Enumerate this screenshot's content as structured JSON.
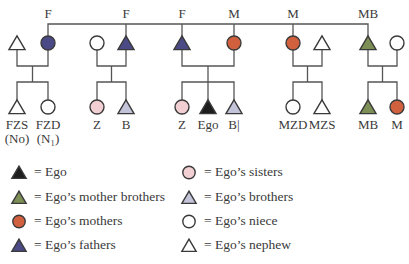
{
  "colors": {
    "line": "#555555",
    "ego": "#1e1e1e",
    "mother_brother": "#7d8f57",
    "mother": "#d1603f",
    "father": "#4b4a86",
    "sister": "#f2cfd3",
    "brother": "#c3c4da",
    "open": "#ffffff"
  },
  "top_labels": [
    {
      "text": "F",
      "x": 48
    },
    {
      "text": "F",
      "x": 126
    },
    {
      "text": "F",
      "x": 182
    },
    {
      "text": "M",
      "x": 234
    },
    {
      "text": "M",
      "x": 293
    },
    {
      "text": "MB",
      "x": 368
    }
  ],
  "parents_row": [
    {
      "shape": "triangle",
      "fill": "open",
      "x": 17
    },
    {
      "shape": "circle",
      "fill": "father",
      "x": 48
    },
    {
      "shape": "circle",
      "fill": "open",
      "x": 97
    },
    {
      "shape": "triangle",
      "fill": "father",
      "x": 126
    },
    {
      "shape": "triangle",
      "fill": "father",
      "x": 182
    },
    {
      "shape": "circle",
      "fill": "mother",
      "x": 234
    },
    {
      "shape": "circle",
      "fill": "mother",
      "x": 293
    },
    {
      "shape": "triangle",
      "fill": "open",
      "x": 322
    },
    {
      "shape": "triangle",
      "fill": "mother_brother",
      "x": 368
    },
    {
      "shape": "circle",
      "fill": "open",
      "x": 397
    }
  ],
  "children_row": [
    {
      "shape": "triangle",
      "fill": "open",
      "x": 17,
      "label": "FZS",
      "sublabel": "(No)"
    },
    {
      "shape": "circle",
      "fill": "open",
      "x": 48,
      "label": "FZD",
      "sublabel": "(N₁)"
    },
    {
      "shape": "circle",
      "fill": "sister",
      "x": 97,
      "label": "Z"
    },
    {
      "shape": "triangle",
      "fill": "brother",
      "x": 126,
      "label": "B"
    },
    {
      "shape": "circle",
      "fill": "sister",
      "x": 182,
      "label": "Z"
    },
    {
      "shape": "triangle",
      "fill": "ego",
      "x": 208,
      "label": "Ego"
    },
    {
      "shape": "triangle",
      "fill": "brother",
      "x": 234,
      "label": "B|"
    },
    {
      "shape": "circle",
      "fill": "open",
      "x": 293,
      "label": "MZD"
    },
    {
      "shape": "triangle",
      "fill": "open",
      "x": 322,
      "label": "MZS"
    },
    {
      "shape": "triangle",
      "fill": "mother_brother",
      "x": 368,
      "label": "MB"
    },
    {
      "shape": "circle",
      "fill": "mother",
      "x": 397,
      "label": "M"
    }
  ],
  "legend": {
    "left": [
      {
        "shape": "triangle",
        "fill": "ego",
        "text": "= Ego"
      },
      {
        "shape": "triangle",
        "fill": "mother_brother",
        "text": "= Ego’s mother brothers"
      },
      {
        "shape": "circle",
        "fill": "mother",
        "text": "= Ego’s mothers"
      },
      {
        "shape": "triangle",
        "fill": "father",
        "text": "= Ego’s fathers"
      }
    ],
    "right": [
      {
        "shape": "circle",
        "fill": "sister",
        "text": "= Ego’s sisters"
      },
      {
        "shape": "triangle",
        "fill": "brother",
        "text": "= Ego’s brothers"
      },
      {
        "shape": "circle",
        "fill": "open",
        "text": "= Ego’s niece"
      },
      {
        "shape": "triangle",
        "fill": "open",
        "text": "= Ego’s nephew"
      }
    ]
  }
}
